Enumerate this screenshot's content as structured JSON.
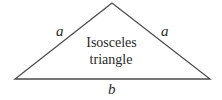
{
  "diagram": {
    "shape": "isosceles-triangle",
    "title_lines": [
      "Isosceles",
      "triangle"
    ],
    "labels": {
      "left_side": "a",
      "right_side": "a",
      "base": "b"
    },
    "vertices": {
      "apex": [
        112,
        3
      ],
      "left": [
        15,
        79
      ],
      "right": [
        210,
        79
      ]
    },
    "colors": {
      "stroke": "#4a4a4a",
      "text": "#2a2a2a",
      "background": "#ffffff"
    }
  }
}
